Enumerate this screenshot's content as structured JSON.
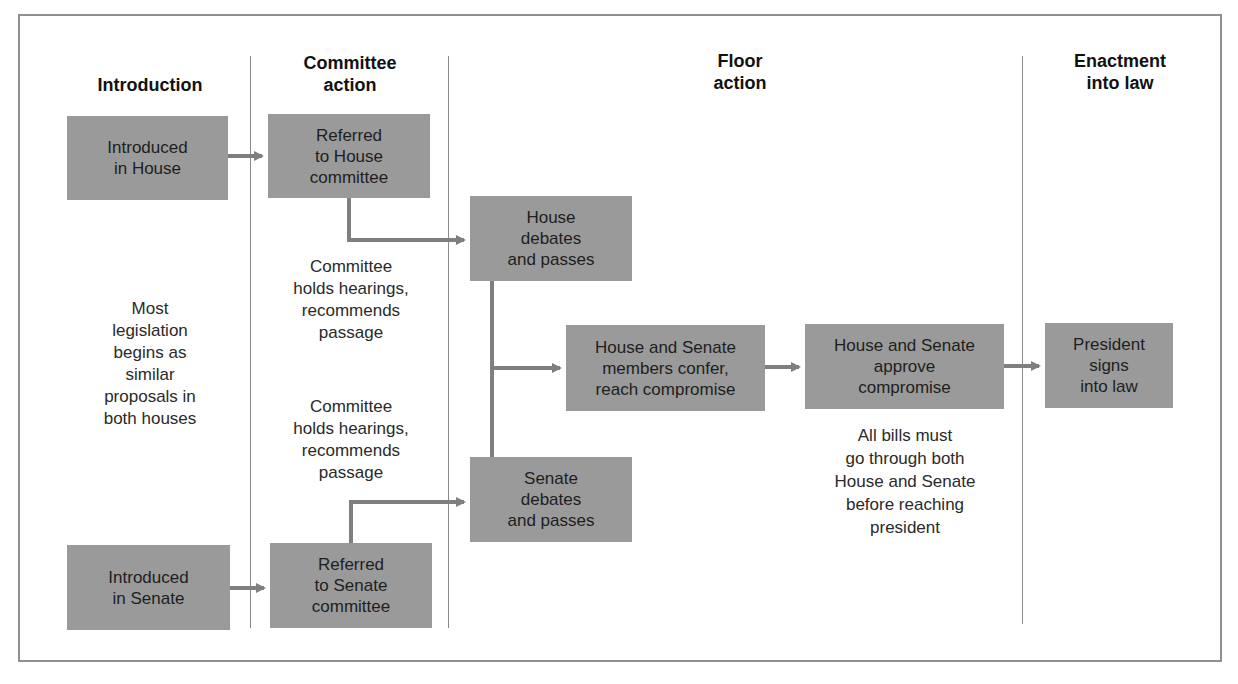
{
  "diagram": {
    "columns": [
      {
        "id": "introduction",
        "label": "Introduction"
      },
      {
        "id": "committee",
        "label": "Committee\naction"
      },
      {
        "id": "floor",
        "label": "Floor\naction"
      },
      {
        "id": "enactment",
        "label": "Enactment\ninto law"
      }
    ],
    "boxes": {
      "introduced_house": "Introduced\nin House",
      "referred_house": "Referred\nto House\ncommittee",
      "house_debates": "House\ndebates\nand passes",
      "confer": "House and Senate\nmembers confer,\nreach compromise",
      "approve": "House and Senate\napprove\ncompromise",
      "president": "President\nsigns\ninto law",
      "senate_debates": "Senate\ndebates\nand passes",
      "introduced_senate": "Introduced\nin Senate",
      "referred_senate": "Referred\nto Senate\ncommittee"
    },
    "notes": {
      "most_legislation": "Most\nlegislation\nbegins as\nsimilar\nproposals in\nboth houses",
      "committee_house": "Committee\nholds hearings,\nrecommends\npassage",
      "committee_senate": "Committee\nholds hearings,\nrecommends\npassage",
      "all_bills": "All bills must\ngo through both\nHouse and Senate\nbefore reaching\npresident"
    },
    "edges": [
      {
        "from": "introduced_house",
        "to": "referred_house"
      },
      {
        "from": "referred_house",
        "to": "house_debates"
      },
      {
        "from": "introduced_senate",
        "to": "referred_senate"
      },
      {
        "from": "referred_senate",
        "to": "senate_debates"
      },
      {
        "from": "house_debates",
        "to": "confer"
      },
      {
        "from": "senate_debates",
        "to": "confer"
      },
      {
        "from": "confer",
        "to": "approve"
      },
      {
        "from": "approve",
        "to": "president"
      }
    ],
    "colors": {
      "box": "#9a9a9a",
      "arrow": "#7f7f7f",
      "frame": "#8f8f8f",
      "divider": "#8a8a8a"
    }
  }
}
